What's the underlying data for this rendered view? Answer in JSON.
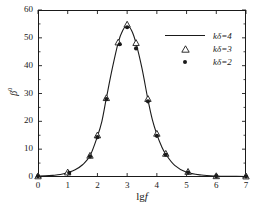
{
  "chart_data": {
    "type": "line",
    "title": "",
    "xlabel": "lg f",
    "ylabel": "β",
    "ylabel_sup": "0",
    "xlim": [
      0,
      7
    ],
    "ylim": [
      0,
      60
    ],
    "xticks": [
      "0",
      "1",
      "2",
      "3",
      "4",
      "5",
      "6",
      "7"
    ],
    "yticks": [
      "0",
      "10",
      "20",
      "30",
      "40",
      "50",
      "60"
    ],
    "y_minor_tick_step": 5,
    "grid": false,
    "legend_position": "upper-right",
    "series": [
      {
        "name": "kδ=4",
        "marker": "line",
        "x": [
          0.0,
          0.25,
          0.5,
          0.75,
          1.0,
          1.25,
          1.5,
          1.75,
          2.0,
          2.15,
          2.3,
          2.5,
          2.7,
          2.85,
          3.0,
          3.15,
          3.3,
          3.5,
          3.7,
          3.85,
          4.0,
          4.15,
          4.3,
          4.6,
          5.0,
          5.5,
          6.0,
          6.5,
          7.0
        ],
        "values": [
          0.3,
          0.4,
          0.6,
          0.9,
          1.6,
          2.6,
          4.4,
          7.6,
          14.6,
          20.0,
          28.3,
          39.0,
          48.3,
          52.6,
          54.5,
          52.6,
          48.0,
          39.0,
          27.8,
          20.5,
          15.3,
          11.2,
          8.2,
          4.2,
          1.7,
          0.7,
          0.35,
          0.25,
          0.2
        ]
      },
      {
        "name": "kδ=3",
        "marker": "triangle-open",
        "x": [
          0.0,
          1.0,
          1.75,
          2.0,
          2.3,
          2.7,
          3.0,
          3.3,
          3.7,
          4.0,
          4.3,
          5.05,
          6.0,
          7.0
        ],
        "values": [
          0.3,
          1.7,
          7.7,
          15.0,
          28.4,
          48.4,
          54.8,
          48.2,
          28.1,
          15.6,
          8.4,
          1.9,
          0.35,
          0.25
        ]
      },
      {
        "name": "kδ=2",
        "marker": "circle-filled",
        "x": [
          0.0,
          1.05,
          1.75,
          2.0,
          2.3,
          2.75,
          3.0,
          3.3,
          3.7,
          4.0,
          4.3,
          5.05,
          6.0,
          7.0
        ],
        "values": [
          0.3,
          1.5,
          7.4,
          14.3,
          28.0,
          47.7,
          53.8,
          46.2,
          27.2,
          14.8,
          8.0,
          1.6,
          0.3,
          0.2
        ]
      }
    ]
  },
  "axes": {
    "x_tick_labels": [
      "0",
      "1",
      "2",
      "3",
      "4",
      "5",
      "6",
      "7"
    ],
    "y_tick_labels": [
      "0",
      "10",
      "20",
      "30",
      "40",
      "50",
      "60"
    ],
    "x_axis_title": "lg",
    "x_axis_title_italic": "f",
    "y_axis_title": "β",
    "y_axis_title_sup": "0"
  },
  "legend": {
    "entries": [
      {
        "label": "kδ=4",
        "marker": "line"
      },
      {
        "label": "kδ=3",
        "marker": "triangle-open"
      },
      {
        "label": "kδ=2",
        "marker": "circle-filled"
      }
    ]
  },
  "colors": {
    "foreground": "#1a1a1a",
    "background": "#ffffff",
    "curve": "#1a1a1a"
  }
}
